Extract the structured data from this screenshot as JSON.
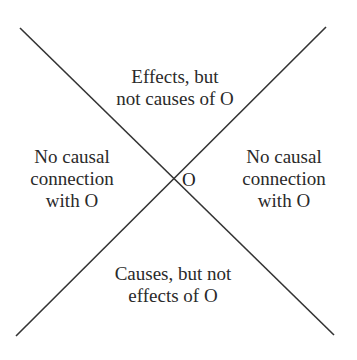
{
  "diagram": {
    "type": "causal-cone-diagram",
    "origin": {
      "label": "O"
    },
    "line_color": "#333333",
    "regions": {
      "top": {
        "lines": [
          "Effects, but",
          "not causes of O"
        ]
      },
      "left": {
        "lines": [
          "No causal",
          "connection",
          "with O"
        ]
      },
      "right": {
        "lines": [
          "No causal",
          "connection",
          "with O"
        ]
      },
      "bottom": {
        "lines": [
          "Causes, but not",
          "effects of O"
        ]
      }
    }
  }
}
